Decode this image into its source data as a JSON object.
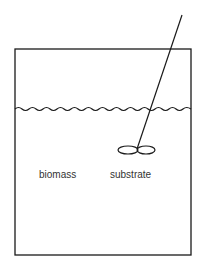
{
  "diagram": {
    "type": "stirred-tank-reactor",
    "labels": {
      "biomass": "biomass",
      "substrate": "substrate"
    },
    "components": [
      "vessel",
      "liquid-surface",
      "stirrer-shaft",
      "impeller"
    ],
    "colors": {
      "stroke": "#1a1a1a",
      "text": "#333333",
      "background": "#ffffff"
    }
  }
}
